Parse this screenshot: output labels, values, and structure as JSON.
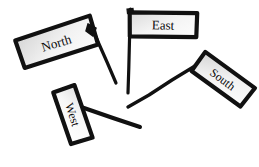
{
  "scene": {
    "title": "Direction Flags",
    "background_color": "#ffffff",
    "ink_color": "#111111",
    "style": "hand-drawn"
  },
  "flags": [
    {
      "id": "north",
      "label": "North",
      "rotation_deg": -17,
      "fill_start": "#d9d9d9",
      "fill_end": "#fbfbfb",
      "stroke_color": "#111111",
      "stroke_width": 4,
      "font_size": 13,
      "banner": {
        "x": 17,
        "y": 27,
        "width": 79,
        "height": 30
      },
      "pole": {
        "x1": 91,
        "y1": 28,
        "x2": 118,
        "y2": 88,
        "width": 3
      }
    },
    {
      "id": "east",
      "label": "East",
      "rotation_deg": 1,
      "fill_start": "#dcdcdc",
      "fill_end": "#fcfcfc",
      "stroke_color": "#111111",
      "stroke_width": 4,
      "font_size": 13,
      "banner": {
        "x": 129,
        "y": 12,
        "width": 68,
        "height": 25
      },
      "pole": {
        "x1": 130,
        "y1": 10,
        "x2": 128,
        "y2": 93,
        "width": 3
      }
    },
    {
      "id": "south",
      "label": "South",
      "rotation_deg": 37,
      "fill_start": "#d7d7d7",
      "fill_end": "#fdfdfd",
      "stroke_color": "#111111",
      "stroke_width": 4,
      "font_size": 12,
      "banner": {
        "x": 192,
        "y": 67,
        "width": 62,
        "height": 24
      },
      "pole": {
        "x1": 194,
        "y1": 68,
        "x2": 128,
        "y2": 108,
        "width": 3
      }
    },
    {
      "id": "west",
      "label": "West",
      "rotation_deg": 72,
      "fill_start": "#e2e2e2",
      "fill_end": "#ffffff",
      "stroke_color": "#111111",
      "stroke_width": 4,
      "font_size": 12,
      "banner": {
        "x": 45,
        "y": 103,
        "width": 56,
        "height": 23
      },
      "pole": {
        "x1": 57,
        "y1": 100,
        "x2": 140,
        "y2": 128,
        "width": 4
      }
    }
  ]
}
